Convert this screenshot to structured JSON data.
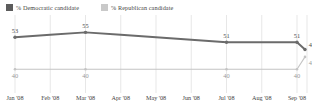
{
  "legend": {
    "items": [
      {
        "label": "% Democratic candidate",
        "color": "#5c5c5c",
        "key": "dem"
      },
      {
        "label": "% Republican candidate",
        "color": "#c9c9c9",
        "key": "rep"
      }
    ]
  },
  "chart_data": {
    "type": "line",
    "title": "",
    "subtitle": "",
    "xlabel": "",
    "ylabel": "",
    "grid": true,
    "legend_position": "top-left",
    "ylim": [
      36,
      58
    ],
    "categories": [
      "Jan '08",
      "Feb '08",
      "Mar '08",
      "Apr '08",
      "May '08",
      "Jun '08",
      "Jul '08",
      "Aug '08",
      "Sep '08"
    ],
    "series": [
      {
        "name": "% Democratic candidate",
        "color": "#6b6b6b",
        "values": [
          53,
          54,
          55,
          54,
          53,
          52,
          51,
          51,
          51
        ],
        "final_value": 48,
        "labels": [
          {
            "index": 0,
            "text": "53"
          },
          {
            "index": 2,
            "text": "55"
          },
          {
            "index": 6,
            "text": "51"
          },
          {
            "index": 8,
            "text": "51"
          },
          {
            "index": 9,
            "text": "48"
          }
        ]
      },
      {
        "name": "% Republican candidate",
        "color": "#c4c4c4",
        "values": [
          40,
          40,
          40,
          40,
          40,
          40,
          40,
          40,
          40
        ],
        "final_value": 45,
        "labels": [
          {
            "index": 0,
            "text": "40"
          },
          {
            "index": 2,
            "text": "40"
          },
          {
            "index": 6,
            "text": "40"
          },
          {
            "index": 8,
            "text": "40"
          },
          {
            "index": 9,
            "text": "45"
          }
        ]
      }
    ]
  },
  "axis": {
    "ticks": [
      "Jan '08",
      "Feb '08",
      "Mar '08",
      "Apr '08",
      "May '08",
      "Jun '08",
      "Jul '08",
      "Aug '08",
      "Sep '08"
    ]
  }
}
